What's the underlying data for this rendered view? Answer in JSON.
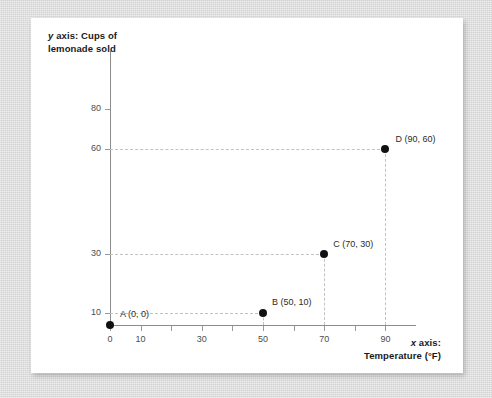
{
  "chart_data": {
    "type": "scatter",
    "title": "",
    "xlabel": "x axis: Temperature (°F)",
    "xlabel_italic_prefix": "x",
    "xlabel_rest": " axis:",
    "xlabel_line2": "Temperature (°F)",
    "ylabel": "y axis: Cups of lemonade sold",
    "ylabel_italic_prefix": "y",
    "ylabel_rest": " axis: Cups of",
    "ylabel_line2": "lemonade sold",
    "xlim": [
      0,
      100
    ],
    "ylim": [
      0,
      90
    ],
    "grid": true,
    "grid_style": "dashed-guides-to-points",
    "legend": "none",
    "xticks": [
      0,
      10,
      30,
      50,
      70,
      90
    ],
    "xtick_labels": [
      "0",
      "10",
      "30",
      "50",
      "70",
      "90"
    ],
    "xticks_unlabeled": [
      20,
      40,
      60,
      80
    ],
    "yticks": [
      10,
      30,
      60,
      80
    ],
    "ytick_labels": [
      "10",
      "30",
      "60",
      "80"
    ],
    "x": [
      0,
      50,
      70,
      90
    ],
    "values": [
      0,
      10,
      30,
      60
    ],
    "points": [
      {
        "name": "A",
        "x": 0,
        "y": 0,
        "label": "A (0, 0)"
      },
      {
        "name": "B",
        "x": 50,
        "y": 10,
        "label": "B (50, 10)"
      },
      {
        "name": "C",
        "x": 70,
        "y": 30,
        "label": "C (70, 30)"
      },
      {
        "name": "D",
        "x": 90,
        "y": 60,
        "label": "D (90, 60)"
      }
    ],
    "colors": {
      "point": "#111111",
      "axis": "#8c8c8c",
      "grid": "#c2c2c2",
      "tick_label": "#4d4d4d",
      "axis_label": "#1a1a1a",
      "card_background": "#ffffff",
      "page_background": "#d9d9d9"
    }
  }
}
